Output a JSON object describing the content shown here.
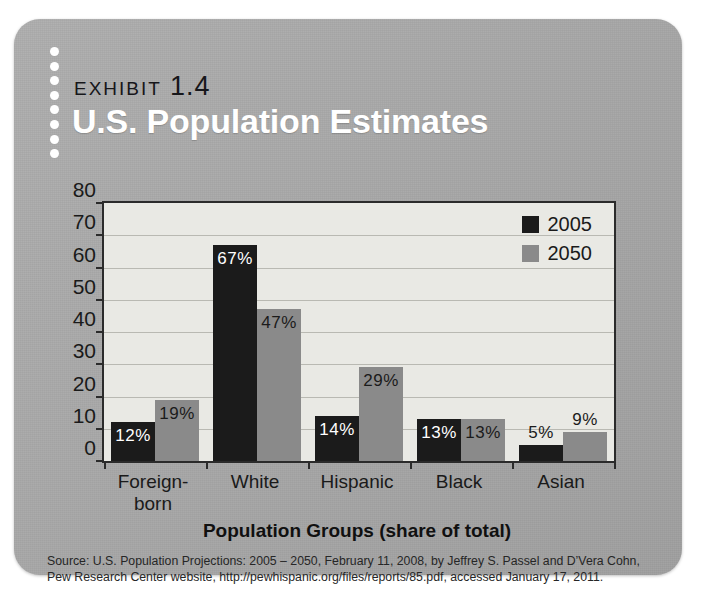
{
  "card": {
    "background_color": "#a9a9a9",
    "exhibit_word": "Exhibit",
    "exhibit_number": "1.4",
    "title": "U.S. Population Estimates"
  },
  "source": {
    "line1": "Source: U.S. Population Projections: 2005 – 2050, February 11, 2008, by Jeffrey S. Passel and D’Vera Cohn,",
    "line2": "Pew Research Center website, http://pewhispanic.org/files/reports/85.pdf, accessed January 17, 2011."
  },
  "chart_data": {
    "type": "bar",
    "title": "U.S. Population Estimates",
    "xlabel": "Population Groups (share of total)",
    "ylabel": "",
    "ylim": [
      0,
      80
    ],
    "ytick_step": 10,
    "yticks": [
      "80",
      "70",
      "60",
      "50",
      "40",
      "30",
      "20",
      "10",
      "0"
    ],
    "grid": true,
    "legend_position": "top-right",
    "categories": [
      "Foreign-born",
      "White",
      "Hispanic",
      "Black",
      "Asian"
    ],
    "category_lines": [
      [
        "Foreign-",
        "born"
      ],
      [
        "White",
        ""
      ],
      [
        "Hispanic",
        ""
      ],
      [
        "Black",
        ""
      ],
      [
        "Asian",
        ""
      ]
    ],
    "series": [
      {
        "name": "2005",
        "color": "#1b1b1b",
        "values": [
          12,
          67,
          14,
          13,
          5
        ],
        "labels": [
          "12%",
          "67%",
          "14%",
          "13%",
          "5%"
        ]
      },
      {
        "name": "2050",
        "color": "#8a8a8a",
        "values": [
          19,
          47,
          29,
          13,
          9
        ],
        "labels": [
          "19%",
          "47%",
          "29%",
          "13%",
          "9%"
        ]
      }
    ]
  }
}
